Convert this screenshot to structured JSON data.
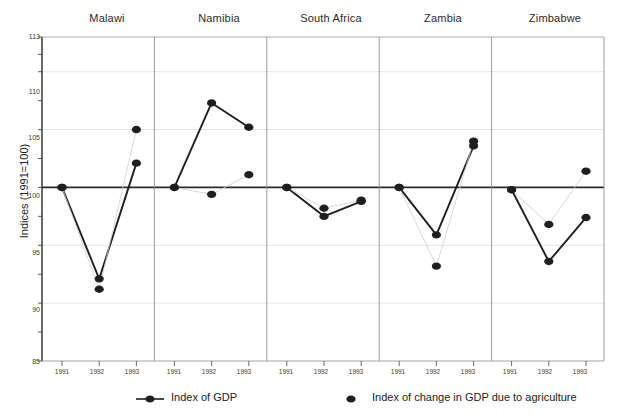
{
  "chart_data": {
    "type": "line",
    "title": "",
    "subtitle": "",
    "ylabel": "Indices (1991=100)",
    "xlabel": "",
    "ylim": [
      85,
      113
    ],
    "yticks": [
      85,
      90,
      95,
      100,
      105,
      110,
      113
    ],
    "ytick_labels": [
      "85",
      "90",
      "95",
      "100",
      "105",
      "110",
      "113"
    ],
    "grid": true,
    "legend_position": "bottom",
    "panels": [
      "Malawi",
      "Namibia",
      "South Africa",
      "Zambia",
      "Zimbabwe"
    ],
    "x": [
      1991,
      1992,
      1993
    ],
    "xtick_labels": [
      "1991",
      "1992",
      "1993"
    ],
    "legend": [
      {
        "name": "Index of GDP",
        "marker": "filled-circle",
        "line": true,
        "color": "#1f1f1f"
      },
      {
        "name": "Index of change in GDP due to agriculture",
        "marker": "filled-circle",
        "line": false,
        "color": "#1f1f1f"
      }
    ],
    "series": [
      {
        "name": "Index of GDP",
        "panels": [
          {
            "panel": "Malawi",
            "values": [
              100.0,
              92.1,
              102.1
            ]
          },
          {
            "panel": "Namibia",
            "values": [
              100.0,
              107.3,
              105.2
            ]
          },
          {
            "panel": "South Africa",
            "values": [
              100.0,
              97.5,
              98.8
            ]
          },
          {
            "panel": "Zambia",
            "values": [
              100.0,
              95.9,
              103.6
            ]
          },
          {
            "panel": "Zimbabwe",
            "values": [
              99.8,
              93.6,
              97.4
            ]
          }
        ]
      },
      {
        "name": "Index of change in GDP due to agriculture",
        "panels": [
          {
            "panel": "Malawi",
            "values": [
              100.0,
              91.2,
              105.0
            ]
          },
          {
            "panel": "Namibia",
            "values": [
              100.0,
              99.4,
              101.1
            ]
          },
          {
            "panel": "South Africa",
            "values": [
              100.0,
              98.2,
              98.9
            ]
          },
          {
            "panel": "Zambia",
            "values": [
              100.0,
              93.2,
              104.0
            ]
          },
          {
            "panel": "Zimbabwe",
            "values": [
              99.8,
              96.8,
              101.4
            ]
          }
        ]
      }
    ]
  },
  "axes": {
    "y_title": "Indices (1991=100)",
    "y_labels": [
      "113",
      "110",
      "105",
      "100",
      "95",
      "90",
      "85"
    ],
    "x_labels": [
      "1991",
      "1992",
      "1993"
    ]
  },
  "panel_titles": {
    "p0": "Malawi",
    "p1": "Namibia",
    "p2": "South Africa",
    "p3": "Zambia",
    "p4": "Zimbabwe"
  },
  "legend": {
    "gdp": "Index of GDP",
    "agriculture": "Index of change in GDP due to agriculture"
  }
}
